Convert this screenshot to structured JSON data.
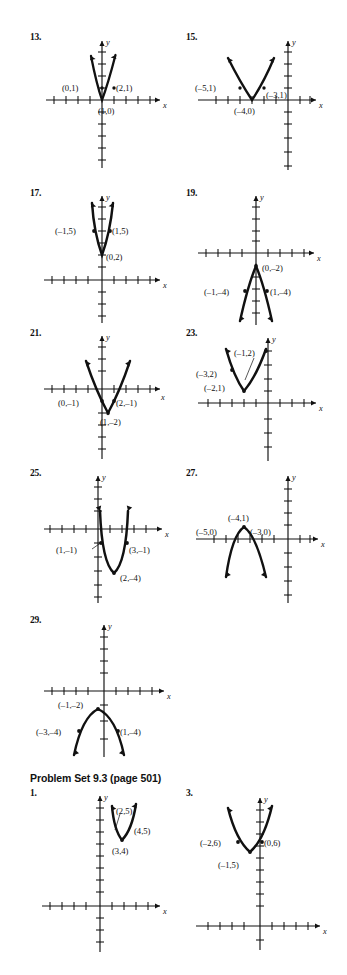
{
  "page": {
    "background": "#ffffff",
    "ink": "#111111"
  },
  "section": {
    "heading": "Problem Set 9.3 (page 501)"
  },
  "axis_labels": {
    "x": "x",
    "y": "y"
  },
  "problems": [
    {
      "number": "13.",
      "direction": "up",
      "vertex": "(1,0)",
      "points": [
        "(0,1)",
        "(2,1)"
      ],
      "labels": {
        "vertex": "(1,0)",
        "left": "(0,1)",
        "right": "(2,1)"
      }
    },
    {
      "number": "15.",
      "direction": "up",
      "vertex": "(-4,0)",
      "points": [
        "(-5,1)",
        "(-3,1)"
      ],
      "labels": {
        "vertex": "(–4,0)",
        "left": "(–5,1)",
        "right": "(–3,1)"
      }
    },
    {
      "number": "17.",
      "direction": "up",
      "vertex": "(0,2)",
      "points": [
        "(-1,5)",
        "(1,5)"
      ],
      "labels": {
        "vertex": "(0,2)",
        "left": "(–1,5)",
        "right": "(1,5)"
      }
    },
    {
      "number": "19.",
      "direction": "down",
      "vertex": "(0,-2)",
      "points": [
        "(-1,-4)",
        "(1,-4)"
      ],
      "labels": {
        "vertex": "(0,–2)",
        "left": "(–1,–4)",
        "right": "(1,–4)"
      }
    },
    {
      "number": "21.",
      "direction": "up",
      "vertex": "(1,-2)",
      "points": [
        "(0,-1)",
        "(2,-1)"
      ],
      "labels": {
        "vertex": "(1,–2)",
        "left": "(0,–1)",
        "right": "(2,–1)"
      }
    },
    {
      "number": "23.",
      "direction": "up",
      "vertex": "(-2,1)",
      "points": [
        "(-3,2)",
        "(-1,2)"
      ],
      "labels": {
        "vertex": "(–2,1)",
        "left": "(–3,2)",
        "right": "(–1,2)"
      }
    },
    {
      "number": "25.",
      "direction": "up",
      "vertex": "(2,-4)",
      "points": [
        "(1,-1)",
        "(3,-1)"
      ],
      "labels": {
        "vertex": "(2,–4)",
        "left": "(1,–1)",
        "right": "(3,–1)"
      }
    },
    {
      "number": "27.",
      "direction": "down",
      "vertex": "(-4,1)",
      "points": [
        "(-5,0)",
        "(-3,0)"
      ],
      "labels": {
        "vertex": "(–4,1)",
        "left": "(–5,0)",
        "right": "(–3,0)"
      }
    },
    {
      "number": "29.",
      "direction": "down",
      "vertex": "(-1,-2)",
      "points": [
        "(-3,-4)",
        "(1,-4)"
      ],
      "labels": {
        "vertex": "(–1,–2)",
        "left": "(–3,–4)",
        "right": "(1,–4)"
      }
    },
    {
      "number": "1.",
      "direction": "up",
      "vertex": "(3,4)",
      "points": [
        "(2,5)",
        "(4,5)"
      ],
      "labels": {
        "vertex": "(3,4)",
        "left": "(2,5)",
        "right": "(4,5)"
      }
    },
    {
      "number": "3.",
      "direction": "up",
      "vertex": "(-1,5)",
      "points": [
        "(-2,6)",
        "(0,6)"
      ],
      "labels": {
        "vertex": "(–1,5)",
        "left": "(–2,6)",
        "right": "(0,6)"
      }
    }
  ]
}
